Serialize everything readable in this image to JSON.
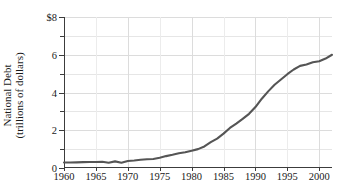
{
  "chart_data": {
    "type": "line",
    "title": "",
    "xlabel": "",
    "ylabel": "National Debt (trillions of dollars)",
    "ylabel_line1": "National Debt",
    "ylabel_line2": "(trillions of dollars)",
    "xlim": [
      1960,
      2002
    ],
    "ylim": [
      0,
      8
    ],
    "grid": true,
    "legend": "none",
    "y_ticks_major": [
      "$8",
      "6",
      "4",
      "2",
      "0"
    ],
    "y_tick_values_major": [
      8,
      6,
      4,
      2,
      0
    ],
    "y_tick_values_minor": [
      7,
      5,
      3,
      1
    ],
    "x_ticks": [
      "1960",
      "1965",
      "1970",
      "1975",
      "1980",
      "1985",
      "1990",
      "1995",
      "2000"
    ],
    "x_tick_values": [
      1960,
      1965,
      1970,
      1975,
      1980,
      1985,
      1990,
      1995,
      2000
    ],
    "x_minor_gridlines": [
      1965,
      1975,
      1985,
      1995
    ],
    "line_color": "#555555",
    "grid_color": "#e6e6e6",
    "axis_color": "#3c3c3c",
    "series": [
      {
        "name": "National Debt",
        "x": [
          1960,
          1961,
          1962,
          1963,
          1964,
          1965,
          1966,
          1967,
          1968,
          1969,
          1970,
          1971,
          1972,
          1973,
          1974,
          1975,
          1976,
          1977,
          1978,
          1979,
          1980,
          1981,
          1982,
          1983,
          1984,
          1985,
          1986,
          1987,
          1988,
          1989,
          1990,
          1991,
          1992,
          1993,
          1994,
          1995,
          1996,
          1997,
          1998,
          1999,
          2000,
          2001,
          2002
        ],
        "values": [
          0.29,
          0.29,
          0.3,
          0.31,
          0.32,
          0.32,
          0.33,
          0.28,
          0.35,
          0.28,
          0.37,
          0.4,
          0.44,
          0.46,
          0.48,
          0.54,
          0.63,
          0.7,
          0.78,
          0.83,
          0.91,
          1.0,
          1.14,
          1.37,
          1.56,
          1.82,
          2.12,
          2.35,
          2.6,
          2.87,
          3.23,
          3.67,
          4.06,
          4.41,
          4.69,
          4.97,
          5.22,
          5.41,
          5.48,
          5.6,
          5.66,
          5.8,
          6.0
        ]
      }
    ]
  }
}
